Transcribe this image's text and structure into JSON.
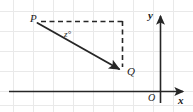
{
  "figure": {
    "type": "coordinate-geometry-diagram",
    "width": 193,
    "height": 112,
    "background_color": "#ffffff",
    "grid": {
      "visible": true,
      "color": "#e8e8e8",
      "spacing_px": 20,
      "x_offset_px": 13,
      "y_offset_px": 11
    },
    "axes": {
      "color": "#262626",
      "x_axis": {
        "label": "x",
        "y_px": 91,
        "x_start_px": 9,
        "x_end_px": 186,
        "arrow": "right"
      },
      "y_axis": {
        "label": "y",
        "x_px": 160,
        "y_start_px": 103,
        "y_end_px": 13,
        "arrow": "up"
      },
      "origin_label": "O"
    },
    "points": [
      {
        "name": "P",
        "label": "P",
        "x_px": 36,
        "y_px": 22
      },
      {
        "name": "Q",
        "label": "Q",
        "x_px": 120,
        "y_px": 70
      }
    ],
    "vector": {
      "name": "PQ",
      "from": "P",
      "to": "Q",
      "style": "solid",
      "color": "#262626",
      "arrow": "at-Q"
    },
    "construction_lines": {
      "style": "dashed",
      "color": "#262626",
      "horizontal": {
        "from_x_px": 40,
        "to_x_px": 123,
        "y_px": 22
      },
      "vertical": {
        "x_px": 123,
        "from_y_px": 22,
        "to_y_px": 68
      }
    },
    "angle": {
      "label": "z°",
      "at_point": "P",
      "between": [
        "horizontal-dashed-line",
        "vector-PQ"
      ],
      "label_x_px": 66,
      "label_y_px": 32
    }
  },
  "labels": {
    "point_p": "P",
    "point_q": "Q",
    "angle_z": "z°",
    "axis_x": "x",
    "axis_y": "y",
    "origin": "O"
  }
}
